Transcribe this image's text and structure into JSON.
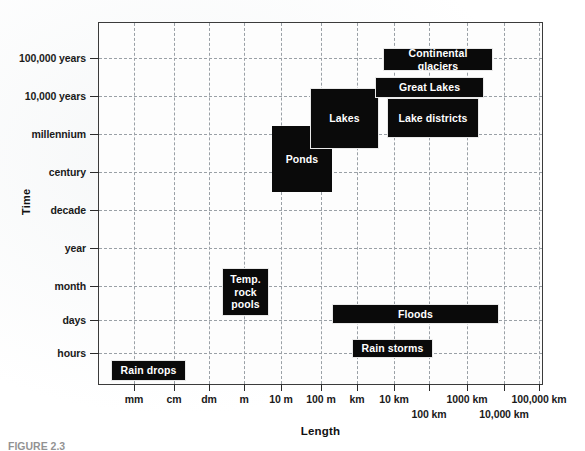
{
  "figure": {
    "caption": "FIGURE 2.3"
  },
  "chart_data": {
    "type": "scatter",
    "title": "",
    "xlabel": "Length",
    "ylabel": "Time",
    "grid": true,
    "legend": "none",
    "x_axis": {
      "label": "Length",
      "ticks": [
        {
          "label": "mm",
          "row": 1,
          "index": 0
        },
        {
          "label": "cm",
          "row": 1,
          "index": 1
        },
        {
          "label": "dm",
          "row": 1,
          "index": 2
        },
        {
          "label": "m",
          "row": 1,
          "index": 3
        },
        {
          "label": "10 m",
          "row": 1,
          "index": 4
        },
        {
          "label": "100 m",
          "row": 1,
          "index": 5
        },
        {
          "label": "km",
          "row": 1,
          "index": 6
        },
        {
          "label": "10 km",
          "row": 1,
          "index": 7
        },
        {
          "label": "100 km",
          "row": 2,
          "index": 8
        },
        {
          "label": "1000 km",
          "row": 1,
          "index": 9
        },
        {
          "label": "10,000 km",
          "row": 2,
          "index": 10
        },
        {
          "label": "100,000 km",
          "row": 1,
          "index": 11
        }
      ]
    },
    "y_axis": {
      "label": "Time",
      "ticks": [
        "100,000 years",
        "10,000 years",
        "millennium",
        "century",
        "decade",
        "year",
        "month",
        "days",
        "hours"
      ]
    },
    "boxes": [
      {
        "name": "Rain drops",
        "label": "Rain drops",
        "x": 12,
        "y": 337,
        "w": 75,
        "h": 21,
        "outline": true
      },
      {
        "name": "Temp. rock pools",
        "label": "Temp.\nrock\npools",
        "x": 123,
        "y": 245,
        "w": 47,
        "h": 48,
        "outline": true
      },
      {
        "name": "Ponds",
        "label": "Ponds",
        "x": 173,
        "y": 103,
        "w": 60,
        "h": 66,
        "outline": false
      },
      {
        "name": "Lakes",
        "label": "Lakes",
        "x": 211,
        "y": 65,
        "w": 69,
        "h": 61,
        "outline": true
      },
      {
        "name": "Lake districts",
        "label": "Lake districts",
        "x": 288,
        "y": 75,
        "w": 92,
        "h": 40,
        "outline": true
      },
      {
        "name": "Great Lakes",
        "label": "Great Lakes",
        "x": 276,
        "y": 54,
        "w": 109,
        "h": 21,
        "outline": true
      },
      {
        "name": "Continental glaciers",
        "label": "Continental glaciers",
        "x": 284,
        "y": 25,
        "w": 110,
        "h": 23,
        "outline": true
      },
      {
        "name": "Floods",
        "label": "Floods",
        "x": 233,
        "y": 281,
        "w": 167,
        "h": 20,
        "outline": true
      },
      {
        "name": "Rain storms",
        "label": "Rain storms",
        "x": 253,
        "y": 316,
        "w": 81,
        "h": 19,
        "outline": true
      }
    ]
  },
  "geometry": {
    "plot_left": 98,
    "plot_top": 22,
    "plot_width": 445,
    "plot_height": 363,
    "y_tick_positions": [
      35,
      73,
      111,
      149,
      187,
      225,
      263,
      297,
      330
    ],
    "x_tick_positions": [
      35,
      75,
      110,
      145,
      182,
      222,
      258,
      295,
      330,
      368,
      405,
      440
    ]
  }
}
